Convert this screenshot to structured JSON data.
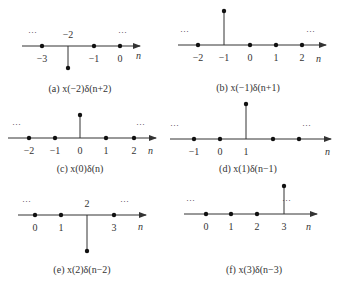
{
  "figure": {
    "ellipsis": "···",
    "axis_label": "n",
    "panels": [
      {
        "id": "a",
        "caption": "(a) x(−2)δ(n+2)",
        "axis": {
          "y": 46,
          "x1": 22,
          "x2": 140
        },
        "n_label_pos": [
          136,
          59
        ],
        "ellipsis_pos": [
          [
            28,
            35
          ],
          [
            118,
            35
          ]
        ],
        "points": [
          {
            "n": -3,
            "label": "−3",
            "x": 42,
            "stem": false
          },
          {
            "n": -2,
            "label": "−2",
            "x": 68,
            "stem": true,
            "tip_y": 68,
            "label_above": true
          },
          {
            "n": -1,
            "label": "−1",
            "x": 94,
            "stem": false
          },
          {
            "n": 0,
            "label": "0",
            "x": 120,
            "stem": false
          }
        ],
        "caption_pos": [
          80,
          92
        ]
      },
      {
        "id": "b",
        "caption": "(b) x(−1)δ(n+1)",
        "axis": {
          "y": 45,
          "x1": 178,
          "x2": 326
        },
        "n_label_pos": [
          316,
          62
        ],
        "ellipsis_pos": [
          [
            180,
            34
          ],
          [
            306,
            34
          ]
        ],
        "points": [
          {
            "n": -2,
            "label": "−2",
            "x": 198,
            "stem": false
          },
          {
            "n": -1,
            "label": "−1",
            "x": 224,
            "stem": true,
            "tip_y": 11
          },
          {
            "n": 0,
            "label": "0",
            "x": 250,
            "stem": false
          },
          {
            "n": 1,
            "label": "1",
            "x": 276,
            "stem": false
          },
          {
            "n": 2,
            "label": "2",
            "x": 302,
            "stem": false
          }
        ],
        "caption_pos": [
          248,
          91
        ]
      },
      {
        "id": "c",
        "caption": "(c) x(0)δ(n)",
        "axis": {
          "y": 138,
          "x1": 8,
          "x2": 156
        },
        "n_label_pos": [
          148,
          154
        ],
        "ellipsis_pos": [
          [
            12,
            127
          ],
          [
            136,
            127
          ]
        ],
        "points": [
          {
            "n": -2,
            "label": "−2",
            "x": 29,
            "stem": false
          },
          {
            "n": -1,
            "label": "−1",
            "x": 55,
            "stem": false
          },
          {
            "n": 0,
            "label": "0",
            "x": 80,
            "stem": true,
            "tip_y": 115
          },
          {
            "n": 1,
            "label": "1",
            "x": 106,
            "stem": false
          },
          {
            "n": 2,
            "label": "2",
            "x": 134,
            "stem": false
          }
        ],
        "caption_pos": [
          80,
          172
        ]
      },
      {
        "id": "d",
        "caption": "(d) x(1)δ(n−1)",
        "axis": {
          "y": 139,
          "x1": 170,
          "x2": 331
        },
        "n_label_pos": [
          325,
          155
        ],
        "ellipsis_pos": [
          [
            170,
            128
          ],
          [
            302,
            128
          ]
        ],
        "points": [
          {
            "n": -1,
            "label": "−1",
            "x": 194,
            "stem": false
          },
          {
            "n": 0,
            "label": "0",
            "x": 220,
            "stem": false
          },
          {
            "n": 1,
            "label": "1",
            "x": 246,
            "stem": true,
            "tip_y": 104
          },
          {
            "n": 2,
            "label": "",
            "x": 273,
            "stem": false
          },
          {
            "n": 3,
            "label": "",
            "x": 299,
            "stem": false
          }
        ],
        "caption_pos": [
          248,
          172
        ]
      },
      {
        "id": "e",
        "caption": "(e) x(2)δ(n−2)",
        "axis": {
          "y": 215,
          "x1": 18,
          "x2": 146
        },
        "n_label_pos": [
          138,
          230
        ],
        "ellipsis_pos": [
          [
            22,
            204
          ],
          [
            120,
            204
          ]
        ],
        "points": [
          {
            "n": 0,
            "label": "0",
            "x": 35,
            "stem": false
          },
          {
            "n": 1,
            "label": "1",
            "x": 61,
            "stem": false
          },
          {
            "n": 2,
            "label": "2",
            "x": 87,
            "stem": true,
            "tip_y": 251,
            "label_above": true
          },
          {
            "n": 3,
            "label": "3",
            "x": 114,
            "stem": false
          }
        ],
        "caption_pos": [
          82,
          273
        ]
      },
      {
        "id": "f",
        "caption": "(f) x(3)δ(n−3)",
        "axis": {
          "y": 214,
          "x1": 184,
          "x2": 317
        },
        "n_label_pos": [
          306,
          230
        ],
        "ellipsis_pos": [
          [
            186,
            203
          ],
          [
            282,
            203
          ]
        ],
        "points": [
          {
            "n": 0,
            "label": "0",
            "x": 206,
            "stem": false
          },
          {
            "n": 1,
            "label": "1",
            "x": 231,
            "stem": false
          },
          {
            "n": 2,
            "label": "2",
            "x": 257,
            "stem": false
          },
          {
            "n": 3,
            "label": "3",
            "x": 284,
            "stem": true,
            "tip_y": 186
          }
        ],
        "caption_pos": [
          254,
          273
        ]
      }
    ]
  }
}
